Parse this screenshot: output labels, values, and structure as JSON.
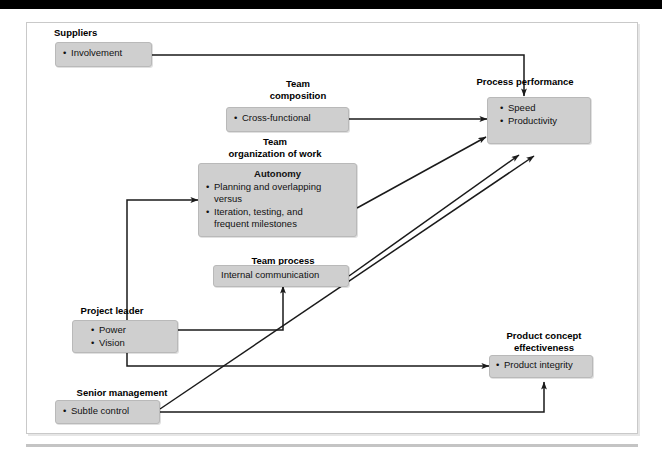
{
  "figure": {
    "type": "flow-diagram",
    "nodes": [
      {
        "id": "suppliers",
        "caption": "Suppliers",
        "title": "",
        "items": [
          "Involvement"
        ]
      },
      {
        "id": "team-composition",
        "caption": "Team\ncomposition",
        "title": "",
        "items": [
          "Cross-functional"
        ]
      },
      {
        "id": "team-organization-of-work",
        "caption": "Team\norganization of work",
        "title": "Autonomy",
        "items": [
          "Planning and overlapping versus",
          "Iteration, testing, and frequent milestones"
        ],
        "item1_line1": "Planning and overlapping",
        "item1_line2": "versus",
        "item2_line1": "Iteration, testing, and",
        "item2_line2": "frequent milestones"
      },
      {
        "id": "team-process",
        "caption": "Team process",
        "title": "",
        "items": [
          "Internal communication"
        ]
      },
      {
        "id": "project-leader",
        "caption": "Project leader",
        "title": "",
        "items": [
          "Power",
          "Vision"
        ]
      },
      {
        "id": "senior-management",
        "caption": "Senior management",
        "title": "",
        "items": [
          "Subtle control"
        ]
      },
      {
        "id": "process-performance",
        "caption": "Process performance",
        "title": "",
        "items": [
          "Speed",
          "Productivity"
        ]
      },
      {
        "id": "product-concept-effectiveness",
        "caption": "Product concept\neffectiveness",
        "title": "",
        "items": [
          "Product integrity"
        ]
      }
    ],
    "edges": [
      {
        "from": "suppliers",
        "to": "process-performance",
        "style": "orthogonal"
      },
      {
        "from": "team-composition",
        "to": "process-performance",
        "style": "straight"
      },
      {
        "from": "team-organization-of-work",
        "to": "process-performance",
        "style": "diagonal"
      },
      {
        "from": "team-process",
        "to": "process-performance",
        "style": "diagonal"
      },
      {
        "from": "project-leader",
        "to": "team-organization-of-work",
        "style": "orthogonal"
      },
      {
        "from": "project-leader",
        "to": "team-process",
        "style": "orthogonal"
      },
      {
        "from": "project-leader",
        "to": "product-concept-effectiveness",
        "style": "orthogonal"
      },
      {
        "from": "senior-management",
        "to": "process-performance",
        "style": "diagonal"
      },
      {
        "from": "senior-management",
        "to": "product-concept-effectiveness",
        "style": "orthogonal"
      }
    ],
    "colors": {
      "node_fill": "#cfcfcf",
      "node_border": "#b9b9b9",
      "line": "#1a1a1a",
      "panel_border": "#c9c9c9",
      "top_bar": "#000000",
      "background": "#ffffff"
    }
  }
}
